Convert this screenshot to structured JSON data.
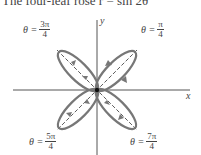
{
  "title": "The four-leaf rose r = sin 2θ",
  "axes": {
    "x_label": "x",
    "y_label": "y"
  },
  "angle_labels": [
    {
      "prefix": "θ =",
      "num": "3π",
      "den": "4"
    },
    {
      "prefix": "θ =",
      "num": "π",
      "den": "4"
    },
    {
      "prefix": "θ =",
      "num": "5π",
      "den": "4"
    },
    {
      "prefix": "θ =",
      "num": "7π",
      "den": "4"
    }
  ],
  "colors": {
    "curve": "#777777",
    "axis": "#555555",
    "dashed": "#333333"
  },
  "curve": {
    "equation": "r = sin 2θ",
    "petals": 4
  }
}
